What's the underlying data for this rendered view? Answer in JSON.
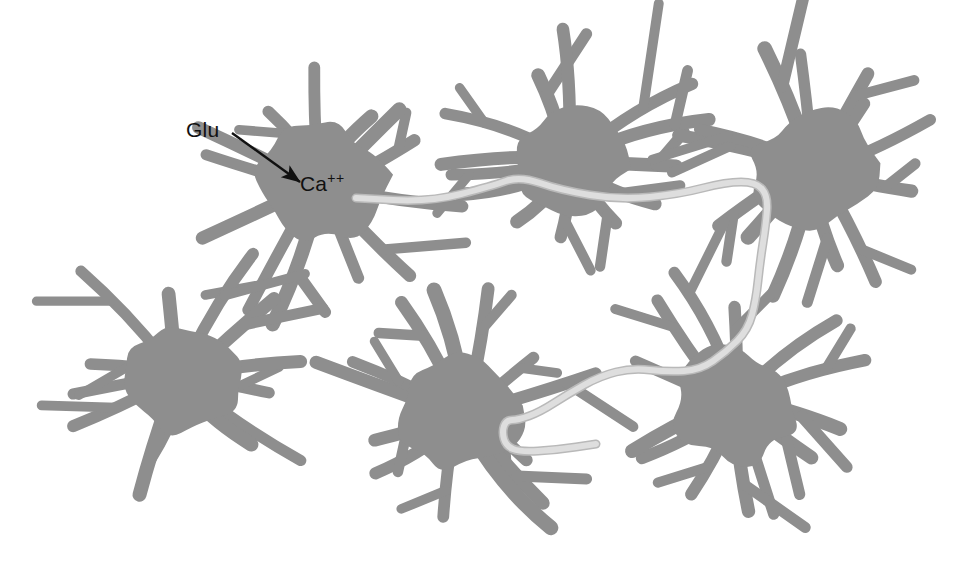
{
  "figure": {
    "background_color": "#ffffff",
    "width": 966,
    "height": 586
  },
  "colors": {
    "cell_gray": "#8e8e8e",
    "wave_light": "#dedede",
    "wave_edge": "#b9b9b9",
    "label_black": "#111111",
    "background": "#ffffff"
  },
  "labels": {
    "glu": "Glu",
    "ca_base": "Ca",
    "ca_charge": "++"
  },
  "annotations": {
    "arrow": {
      "name": "glu-to-ca-arrow",
      "from_x": 232,
      "from_y": 133,
      "to_x": 300,
      "to_y": 182
    }
  },
  "cells": [
    {
      "id": "astrocyte-top-left",
      "cx": 320,
      "cy": 185,
      "rx": 62,
      "ry": 58,
      "rot": -8,
      "processes": 13,
      "seed": 11
    },
    {
      "id": "astrocyte-top-middle",
      "cx": 568,
      "cy": 162,
      "rx": 60,
      "ry": 52,
      "rot": 6,
      "processes": 13,
      "seed": 23
    },
    {
      "id": "astrocyte-top-right",
      "cx": 812,
      "cy": 168,
      "rx": 60,
      "ry": 56,
      "rot": -4,
      "processes": 13,
      "seed": 37
    },
    {
      "id": "astrocyte-bottom-left",
      "cx": 180,
      "cy": 378,
      "rx": 62,
      "ry": 56,
      "rot": 10,
      "processes": 13,
      "seed": 53
    },
    {
      "id": "astrocyte-bottom-middle",
      "cx": 462,
      "cy": 412,
      "rx": 62,
      "ry": 56,
      "rot": -6,
      "processes": 13,
      "seed": 71
    },
    {
      "id": "astrocyte-bottom-right",
      "cx": 736,
      "cy": 404,
      "rx": 60,
      "ry": 56,
      "rot": 4,
      "processes": 13,
      "seed": 89
    }
  ],
  "calcium_wave": {
    "name": "calcium-wave-path",
    "description": "light gray track running from the top-left astrocyte through the top-middle and top-right astrocytes, down the right side and into the bottom-middle astrocyte",
    "points": [
      [
        356,
        198
      ],
      [
        430,
        202
      ],
      [
        492,
        186
      ],
      [
        520,
        176
      ],
      [
        560,
        190
      ],
      [
        620,
        200
      ],
      [
        680,
        194
      ],
      [
        726,
        182
      ],
      [
        756,
        182
      ],
      [
        768,
        196
      ],
      [
        766,
        224
      ],
      [
        760,
        262
      ],
      [
        756,
        300
      ],
      [
        748,
        330
      ],
      [
        726,
        352
      ],
      [
        700,
        370
      ],
      [
        668,
        372
      ],
      [
        632,
        368
      ],
      [
        600,
        376
      ],
      [
        568,
        394
      ],
      [
        540,
        412
      ],
      [
        518,
        420
      ],
      [
        506,
        420
      ],
      [
        502,
        432
      ],
      [
        506,
        446
      ],
      [
        520,
        452
      ],
      [
        556,
        450
      ],
      [
        596,
        444
      ]
    ],
    "stroke_width": 7
  },
  "legend_note": {
    "meaning": "Glutamate (Glu) binding raises intracellular Ca++ in one astrocyte; the calcium signal then spreads as a wave through gap junctions across the glial network."
  }
}
